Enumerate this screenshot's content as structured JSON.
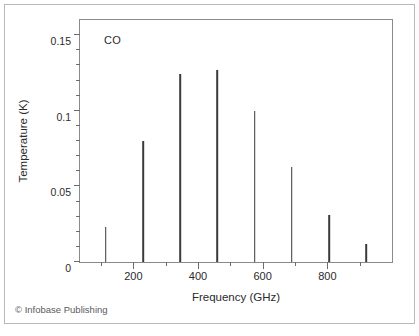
{
  "figure": {
    "credit": "© Infobase Publishing",
    "frame_color": "#8a8a8a",
    "card_border_color": "#b9b9b9",
    "spike_color": "#3a3a3a",
    "background": "#ffffff"
  },
  "chart_data": {
    "type": "bar",
    "title": "",
    "annotation": "CO",
    "xlabel": "Frequency (GHz)",
    "ylabel": "Temperature (K)",
    "xlim": [
      35,
      1000
    ],
    "ylim": [
      0,
      0.16
    ],
    "grid": false,
    "legend": null,
    "x_ticks_major": [
      200,
      400,
      600,
      800
    ],
    "x_tick_labels": [
      "200",
      "400",
      "600",
      "800"
    ],
    "x_ticks_minor": [
      100,
      300,
      500,
      700,
      900
    ],
    "y_ticks_major": [
      0,
      0.05,
      0.1,
      0.15
    ],
    "y_tick_labels": [
      "0",
      "0.05",
      "0.1",
      "0.15"
    ],
    "y_ticks_minor": [
      0.01,
      0.02,
      0.03,
      0.04,
      0.06,
      0.07,
      0.08,
      0.09,
      0.11,
      0.12,
      0.13,
      0.14
    ],
    "categories": [
      115,
      230,
      345,
      460,
      575,
      690,
      805,
      920
    ],
    "x": [
      115,
      230,
      345,
      460,
      575,
      690,
      805,
      920
    ],
    "values": [
      0.023,
      0.08,
      0.124,
      0.127,
      0.1,
      0.063,
      0.031,
      0.012
    ],
    "series": [
      {
        "name": "CO",
        "values": [
          0.023,
          0.08,
          0.124,
          0.127,
          0.1,
          0.063,
          0.031,
          0.012
        ]
      }
    ]
  }
}
